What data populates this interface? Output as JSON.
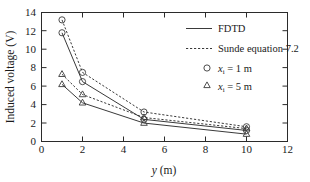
{
  "chart_data": {
    "type": "line",
    "title": "",
    "xlabel": "y (m)",
    "xlabel_italic_part": "y",
    "xlabel_rest": " (m)",
    "ylabel": "Induced voltage (V)",
    "xlim": [
      0,
      12
    ],
    "ylim": [
      0,
      14
    ],
    "xticks": [
      0,
      2,
      4,
      6,
      8,
      10,
      12
    ],
    "yticks": [
      0,
      2,
      4,
      6,
      8,
      10,
      12,
      14
    ],
    "grid": false,
    "legend_position": "upper-right-inside",
    "x": [
      1,
      2,
      5,
      10
    ],
    "series": [
      {
        "name": "FDTD, x_i = 1 m",
        "method": "FDTD",
        "linestyle": "solid",
        "marker": "circle",
        "values": [
          11.8,
          6.5,
          2.4,
          1.2
        ]
      },
      {
        "name": "Sunde equation 7.2, x_i = 1 m",
        "method": "Sunde equation 7.2",
        "linestyle": "dashed",
        "marker": "circle",
        "values": [
          13.2,
          7.5,
          3.2,
          1.6
        ]
      },
      {
        "name": "FDTD, x_i = 5 m",
        "method": "FDTD",
        "linestyle": "solid",
        "marker": "triangle",
        "values": [
          6.2,
          4.2,
          2.0,
          0.8
        ]
      },
      {
        "name": "Sunde equation 7.2, x_i = 5 m",
        "method": "Sunde equation 7.2",
        "linestyle": "dashed",
        "marker": "triangle",
        "values": [
          7.3,
          5.1,
          2.6,
          1.4
        ]
      }
    ],
    "legend": [
      {
        "label": "FDTD",
        "style": "solid-line"
      },
      {
        "label": "Sunde equation 7.2",
        "style": "dashed-line"
      },
      {
        "label_var": "x",
        "label_sub": "i",
        "label_eq": " = 1 m",
        "style": "circle-marker"
      },
      {
        "label_var": "x",
        "label_sub": "i",
        "label_eq": " = 5 m",
        "style": "triangle-marker"
      }
    ],
    "colors": {
      "line": "#3a3a3a",
      "axis": "#2b2b2b",
      "text": "#1a1a1a",
      "background": "#ffffff"
    }
  }
}
